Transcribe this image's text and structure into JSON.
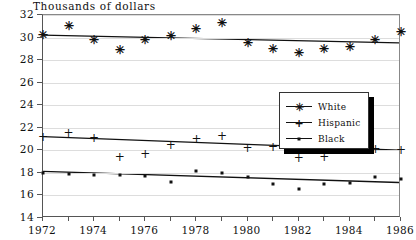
{
  "chart_data": {
    "type": "scatter",
    "title": "Thousands of dollars",
    "xlabel": "",
    "ylabel": "",
    "xlim": [
      1972,
      1986
    ],
    "ylim": [
      14,
      32
    ],
    "grid": true,
    "legend_position": "center-right",
    "ytick_labels": [
      "14",
      "16",
      "18",
      "20",
      "22",
      "24",
      "26",
      "28",
      "30",
      "32"
    ],
    "yticks": [
      14,
      16,
      18,
      20,
      22,
      24,
      26,
      28,
      30,
      32
    ],
    "xticks": [
      1972,
      1973,
      1974,
      1975,
      1976,
      1977,
      1978,
      1979,
      1980,
      1981,
      1982,
      1983,
      1984,
      1985,
      1986
    ],
    "xtick_labels": [
      "1972",
      "",
      "1974",
      "",
      "1976",
      "",
      "1978",
      "",
      "1980",
      "",
      "1982",
      "",
      "1984",
      "",
      "1986"
    ],
    "x": [
      1972,
      1973,
      1974,
      1975,
      1976,
      1977,
      1978,
      1979,
      1980,
      1981,
      1982,
      1983,
      1984,
      1985,
      1986
    ],
    "series": [
      {
        "name": "White",
        "marker": "asterisk",
        "values": [
          30.2,
          31.0,
          29.8,
          28.9,
          29.8,
          30.1,
          30.8,
          31.3,
          29.5,
          29.0,
          28.6,
          29.0,
          29.2,
          29.8,
          30.5
        ],
        "trend_start": 30.2,
        "trend_end": 29.5
      },
      {
        "name": "Hispanic",
        "marker": "plus",
        "values": [
          21.2,
          21.5,
          21.1,
          19.4,
          19.7,
          20.5,
          21.0,
          21.3,
          20.2,
          20.3,
          19.3,
          19.4,
          20.2,
          20.1,
          20.0
        ],
        "trend_start": 21.1,
        "trend_end": 19.9
      },
      {
        "name": "Black",
        "marker": "dot",
        "values": [
          18.0,
          17.9,
          17.8,
          17.8,
          17.7,
          17.2,
          18.2,
          18.0,
          17.6,
          17.0,
          16.6,
          17.0,
          17.1,
          17.6,
          17.5
        ],
        "trend_start": 18.0,
        "trend_end": 17.0
      }
    ]
  },
  "legend": {
    "items": [
      {
        "label": "White"
      },
      {
        "label": "Hispanic"
      },
      {
        "label": "Black"
      }
    ]
  },
  "symbols": {
    "asterisk": "✳",
    "plus": "+"
  },
  "colors": {
    "ink": "#111111",
    "grid": "#dddddd",
    "axis": "#555555"
  }
}
